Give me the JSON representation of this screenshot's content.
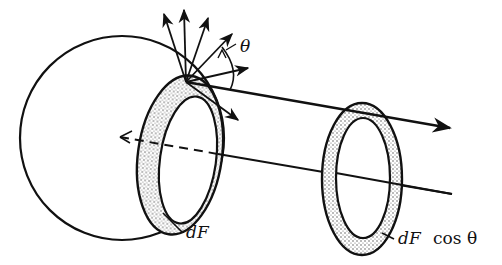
{
  "diagram": {
    "labels": {
      "theta": "θ",
      "dF_left": "dF",
      "dF_right": "dF",
      "cos_theta": "cos θ"
    },
    "colors": {
      "ink": "#111111",
      "background": "#ffffff",
      "stipple": "#555555"
    }
  }
}
